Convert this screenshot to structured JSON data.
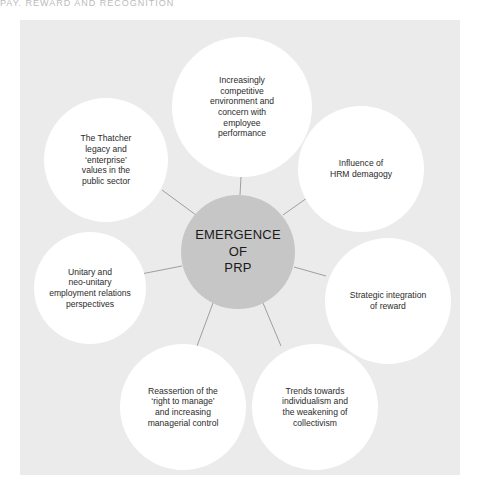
{
  "header": {
    "partial_text": "PAY, REWARD AND RECOGNITION"
  },
  "diagram": {
    "type": "hub-and-spoke",
    "center": {
      "label": "EMERGENCE OF PRP",
      "lines": [
        "EMERGENCE",
        "OF",
        "PRP"
      ],
      "color": "#c6c6c6"
    },
    "nodes": [
      {
        "id": "top",
        "lines": [
          "Increasingly",
          "competitive",
          "environment and",
          "concern with",
          "employee",
          "performance"
        ]
      },
      {
        "id": "upper-right",
        "lines": [
          "Influence of",
          "HRM demagogy"
        ]
      },
      {
        "id": "right",
        "lines": [
          "Strategic integration",
          "of reward"
        ]
      },
      {
        "id": "bottom-right",
        "lines": [
          "Trends towards",
          "individualism and",
          "the weakening of",
          "collectivism"
        ]
      },
      {
        "id": "bottom-left",
        "lines": [
          "Reassertion of the",
          "‘right to manage’",
          "and increasing",
          "managerial control"
        ]
      },
      {
        "id": "left",
        "lines": [
          "Unitary and",
          "neo-unitary",
          "employment relations",
          "perspectives"
        ]
      },
      {
        "id": "upper-left",
        "lines": [
          "The Thatcher",
          "legacy and",
          "‘enterprise’",
          "values in the",
          "public sector"
        ]
      }
    ],
    "colors": {
      "panel_background": "#ebebeb",
      "node_fill": "#ffffff",
      "center_fill": "#c6c6c6",
      "connector": "#8a8a8a"
    }
  }
}
